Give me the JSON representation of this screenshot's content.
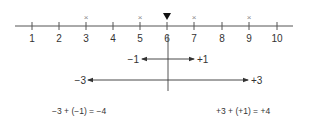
{
  "number_line": {
    "ticks": [
      {
        "value": "1",
        "x": 32
      },
      {
        "value": "2",
        "x": 59
      },
      {
        "value": "3",
        "x": 86
      },
      {
        "value": "4",
        "x": 113
      },
      {
        "value": "5",
        "x": 140
      },
      {
        "value": "6",
        "x": 167
      },
      {
        "value": "7",
        "x": 194
      },
      {
        "value": "8",
        "x": 222
      },
      {
        "value": "9",
        "x": 249
      },
      {
        "value": "10",
        "x": 277
      }
    ],
    "cross_marks_at": [
      "3",
      "5",
      "7",
      "9"
    ],
    "cross_symbol": "×",
    "pointer_at": "6",
    "pointer_icon": "triangle-down-icon",
    "colors": {
      "line": "#555555",
      "marks": "#999999",
      "pointer": "#111111"
    }
  },
  "arrows": {
    "short": {
      "left_label": "−1",
      "right_label": "+1"
    },
    "long": {
      "left_label": "−3",
      "right_label": "+3"
    }
  },
  "equations": {
    "left": "−3 + (−1) = −4",
    "right": "+3 + (+1) = +4"
  }
}
